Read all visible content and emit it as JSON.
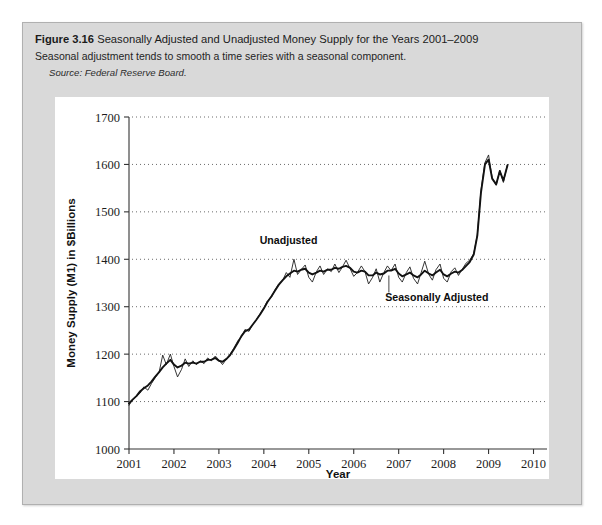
{
  "figure": {
    "number": "Figure 3.16",
    "title": "Seasonally Adjusted and Unadjusted Money Supply for the Years 2001–2009",
    "subtitle": "Seasonal adjustment tends to smooth a time series with a seasonal component.",
    "source": "Source: Federal Reserve Board."
  },
  "colors": {
    "card_background": "#d9d9d9",
    "panel_background": "#ffffff",
    "line": "#1f1f1f",
    "grid": "#6b6b6b"
  },
  "chart_data": {
    "type": "line",
    "title": "Seasonally Adjusted and Unadjusted Money Supply for the Years 2001–2009",
    "xlabel": "Year",
    "ylabel": "Money Supply (M1) in $Billions",
    "xlim": [
      2001,
      2010.3
    ],
    "ylim": [
      1000,
      1700
    ],
    "xticks": [
      2001,
      2002,
      2003,
      2004,
      2005,
      2006,
      2007,
      2008,
      2009,
      2010
    ],
    "xtick_labels": [
      "2001",
      "2002",
      "2003",
      "2004",
      "2005",
      "2006",
      "2007",
      "2008",
      "2009",
      "2010"
    ],
    "yticks": [
      1000,
      1100,
      1200,
      1300,
      1400,
      1500,
      1600,
      1700
    ],
    "ytick_labels": [
      "1000",
      "1100",
      "1200",
      "1300",
      "1400",
      "1500",
      "1600",
      "1700"
    ],
    "grid": "horizontal-dotted",
    "legend": "inline-annotations",
    "annotations": [
      {
        "label": "Unadjusted",
        "x": 2004.55,
        "y": 1432,
        "series": "unadjusted"
      },
      {
        "label": "Seasonally Adjusted",
        "x": 2007.85,
        "y": 1311,
        "series": "seasonally_adjusted"
      }
    ],
    "x": [
      2001.0,
      2001.08,
      2001.17,
      2001.25,
      2001.33,
      2001.42,
      2001.5,
      2001.58,
      2001.67,
      2001.75,
      2001.83,
      2001.92,
      2002.0,
      2002.08,
      2002.17,
      2002.25,
      2002.33,
      2002.42,
      2002.5,
      2002.58,
      2002.67,
      2002.75,
      2002.83,
      2002.92,
      2003.0,
      2003.08,
      2003.17,
      2003.25,
      2003.33,
      2003.42,
      2003.5,
      2003.58,
      2003.67,
      2003.75,
      2003.83,
      2003.92,
      2004.0,
      2004.08,
      2004.17,
      2004.25,
      2004.33,
      2004.42,
      2004.5,
      2004.58,
      2004.67,
      2004.75,
      2004.83,
      2004.92,
      2005.0,
      2005.08,
      2005.17,
      2005.25,
      2005.33,
      2005.42,
      2005.5,
      2005.58,
      2005.67,
      2005.75,
      2005.83,
      2005.92,
      2006.0,
      2006.08,
      2006.17,
      2006.25,
      2006.33,
      2006.42,
      2006.5,
      2006.58,
      2006.67,
      2006.75,
      2006.83,
      2006.92,
      2007.0,
      2007.08,
      2007.17,
      2007.25,
      2007.33,
      2007.42,
      2007.5,
      2007.58,
      2007.67,
      2007.75,
      2007.83,
      2007.92,
      2008.0,
      2008.08,
      2008.17,
      2008.25,
      2008.33,
      2008.42,
      2008.5,
      2008.58,
      2008.67,
      2008.75,
      2008.83,
      2008.92,
      2009.0,
      2009.08,
      2009.17,
      2009.25,
      2009.33,
      2009.42
    ],
    "series": [
      {
        "name": "Unadjusted",
        "style": "thin",
        "values": [
          1092,
          1104,
          1112,
          1118,
          1131,
          1124,
          1138,
          1150,
          1162,
          1198,
          1178,
          1200,
          1174,
          1152,
          1168,
          1190,
          1174,
          1186,
          1178,
          1186,
          1180,
          1192,
          1186,
          1196,
          1188,
          1178,
          1190,
          1200,
          1212,
          1228,
          1236,
          1252,
          1248,
          1262,
          1272,
          1286,
          1298,
          1312,
          1320,
          1336,
          1348,
          1356,
          1372,
          1362,
          1400,
          1368,
          1378,
          1388,
          1362,
          1352,
          1374,
          1386,
          1368,
          1380,
          1374,
          1390,
          1372,
          1384,
          1398,
          1380,
          1364,
          1372,
          1386,
          1374,
          1348,
          1362,
          1380,
          1352,
          1372,
          1386,
          1376,
          1390,
          1362,
          1352,
          1372,
          1384,
          1360,
          1348,
          1372,
          1396,
          1368,
          1356,
          1378,
          1390,
          1360,
          1352,
          1374,
          1382,
          1366,
          1380,
          1392,
          1398,
          1412,
          1452,
          1545,
          1604,
          1620,
          1572,
          1556,
          1588,
          1562,
          1600
        ]
      },
      {
        "name": "Seasonally Adjusted",
        "style": "thick",
        "values": [
          1096,
          1104,
          1112,
          1122,
          1128,
          1134,
          1142,
          1152,
          1162,
          1172,
          1180,
          1188,
          1178,
          1172,
          1176,
          1182,
          1180,
          1182,
          1180,
          1184,
          1184,
          1188,
          1188,
          1192,
          1186,
          1184,
          1190,
          1198,
          1210,
          1224,
          1238,
          1248,
          1252,
          1262,
          1272,
          1284,
          1296,
          1310,
          1322,
          1334,
          1346,
          1356,
          1364,
          1370,
          1376,
          1374,
          1378,
          1380,
          1372,
          1368,
          1372,
          1376,
          1374,
          1378,
          1378,
          1382,
          1380,
          1384,
          1386,
          1382,
          1374,
          1372,
          1376,
          1374,
          1366,
          1366,
          1372,
          1368,
          1370,
          1376,
          1376,
          1380,
          1370,
          1364,
          1368,
          1372,
          1366,
          1362,
          1368,
          1376,
          1370,
          1366,
          1372,
          1378,
          1368,
          1364,
          1370,
          1374,
          1372,
          1378,
          1386,
          1394,
          1410,
          1450,
          1540,
          1600,
          1610,
          1570,
          1558,
          1586,
          1566,
          1598
        ]
      }
    ]
  }
}
